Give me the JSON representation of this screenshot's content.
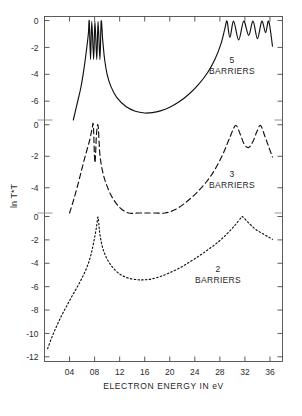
{
  "figure": {
    "title": "",
    "xlabel": "ELECTRON ENERGY  IN eV",
    "ylabel": "ln T*T",
    "xticks": [
      "04",
      "08",
      "12",
      "16",
      "20",
      "24",
      "28",
      "32",
      "36"
    ],
    "panel_labels": {
      "five": {
        "number": "5",
        "word": "BARRIERS"
      },
      "three": {
        "number": "3",
        "word": "BARRIERS"
      },
      "two": {
        "number": "2",
        "word": "BARRIERS"
      }
    },
    "yticks_top": [
      "0",
      "-2",
      "-4",
      "-6"
    ],
    "yticks_mid": [
      "0",
      "-2",
      "-4"
    ],
    "yticks_bot": [
      "0",
      "-2",
      "-4",
      "-6",
      "-8",
      "-10",
      "-12"
    ],
    "colors": {
      "ink": "#111111",
      "frame": "#4a4a4a",
      "paper": "#ffffff"
    }
  },
  "chart_data": {
    "type": "line",
    "title": "",
    "xlabel": "ELECTRON ENERGY  IN eV",
    "ylabel": "ln T*T",
    "xlim": [
      0.0,
      3.8
    ],
    "xtick_values": [
      0.4,
      0.8,
      1.2,
      1.6,
      2.0,
      2.4,
      2.8,
      3.2,
      3.6
    ],
    "xtick_labels": [
      "04",
      "08",
      "12",
      "16",
      "20",
      "24",
      "28",
      "32",
      "36"
    ],
    "grid": false,
    "legend": "inline-annotations",
    "note": "Three stacked panels share one x axis; each panel has its own ln T*T scale, all topping out at 0.",
    "panels": [
      {
        "name": "5 BARRIERS",
        "ylim": [
          -7.4,
          0.3
        ],
        "ytick_values": [
          0,
          -2,
          -4,
          -6
        ],
        "ytick_labels": [
          "0",
          "-2",
          "-4",
          "-6"
        ],
        "linestyle": "solid",
        "annotation": "5 BARRIERS"
      },
      {
        "name": "3 BARRIERS",
        "ylim": [
          -5.6,
          0.3
        ],
        "ytick_values": [
          0,
          -2,
          -4
        ],
        "ytick_labels": [
          "0",
          "-2",
          "-4"
        ],
        "linestyle": "dashed",
        "annotation": "3 BARRIERS"
      },
      {
        "name": "2 BARRIERS",
        "ylim": [
          -12.4,
          0.3
        ],
        "ytick_values": [
          0,
          -2,
          -4,
          -6,
          -8,
          -10,
          -12
        ],
        "ytick_labels": [
          "0",
          "-2",
          "-4",
          "-6",
          "-8",
          "-10",
          "-12"
        ],
        "linestyle": "dotted",
        "annotation": "2 BARRIERS"
      }
    ],
    "series": [
      {
        "name": "5 BARRIERS",
        "panel": 0,
        "linestyle": "solid",
        "description": "Four narrow resonance spikes reaching ln T*T = 0 near 0.72-0.92 eV, a deep opaque valley through mid-energies, then a band of four resonances reaching 0 between 2.85 and 3.6 eV.",
        "points": [
          [
            0.46,
            -7.4
          ],
          [
            0.52,
            -6.2
          ],
          [
            0.58,
            -5.0
          ],
          [
            0.63,
            -3.6
          ],
          [
            0.67,
            -2.2
          ],
          [
            0.7,
            -1.0
          ],
          [
            0.715,
            -0.05
          ],
          [
            0.735,
            -2.9
          ],
          [
            0.755,
            -0.05
          ],
          [
            0.785,
            -2.9
          ],
          [
            0.805,
            -0.05
          ],
          [
            0.835,
            -2.9
          ],
          [
            0.855,
            -0.05
          ],
          [
            0.885,
            -2.9
          ],
          [
            0.905,
            -0.05
          ],
          [
            0.93,
            -1.5
          ],
          [
            0.96,
            -2.9
          ],
          [
            1.0,
            -4.0
          ],
          [
            1.06,
            -4.9
          ],
          [
            1.15,
            -5.7
          ],
          [
            1.3,
            -6.4
          ],
          [
            1.45,
            -6.75
          ],
          [
            1.6,
            -6.88
          ],
          [
            1.72,
            -6.85
          ],
          [
            1.85,
            -6.72
          ],
          [
            2.0,
            -6.45
          ],
          [
            2.15,
            -6.05
          ],
          [
            2.3,
            -5.5
          ],
          [
            2.45,
            -4.8
          ],
          [
            2.6,
            -3.9
          ],
          [
            2.72,
            -2.9
          ],
          [
            2.82,
            -1.7
          ],
          [
            2.88,
            -0.6
          ],
          [
            2.915,
            -0.05
          ],
          [
            2.96,
            -1.25
          ],
          [
            3.02,
            -0.05
          ],
          [
            3.1,
            -1.45
          ],
          [
            3.18,
            -0.05
          ],
          [
            3.26,
            -1.1
          ],
          [
            3.33,
            -0.05
          ],
          [
            3.4,
            -1.35
          ],
          [
            3.47,
            -0.05
          ],
          [
            3.53,
            -0.9
          ],
          [
            3.58,
            -0.05
          ],
          [
            3.64,
            -1.9
          ]
        ]
      },
      {
        "name": "3 BARRIERS",
        "panel": 1,
        "linestyle": "dashed",
        "description": "Two resonance spikes reaching 0 near 0.78 and 0.86 eV, broad minimum near 1.6 eV, rising to two resonances at 0 near 3.05 and 3.45 eV.",
        "points": [
          [
            0.4,
            -5.6
          ],
          [
            0.47,
            -4.7
          ],
          [
            0.54,
            -3.7
          ],
          [
            0.6,
            -2.75
          ],
          [
            0.66,
            -1.85
          ],
          [
            0.72,
            -1.0
          ],
          [
            0.76,
            -0.25
          ],
          [
            0.78,
            -0.05
          ],
          [
            0.805,
            -2.4
          ],
          [
            0.83,
            -0.6
          ],
          [
            0.855,
            -0.05
          ],
          [
            0.885,
            -1.9
          ],
          [
            0.93,
            -3.0
          ],
          [
            0.99,
            -3.8
          ],
          [
            1.08,
            -4.6
          ],
          [
            1.2,
            -5.25
          ],
          [
            1.34,
            -5.65
          ],
          [
            1.5,
            -5.85
          ],
          [
            1.62,
            -5.9
          ],
          [
            1.76,
            -5.85
          ],
          [
            1.92,
            -5.7
          ],
          [
            2.08,
            -5.4
          ],
          [
            2.25,
            -4.95
          ],
          [
            2.42,
            -4.35
          ],
          [
            2.58,
            -3.65
          ],
          [
            2.72,
            -2.85
          ],
          [
            2.85,
            -1.85
          ],
          [
            2.96,
            -0.8
          ],
          [
            3.05,
            -0.05
          ],
          [
            3.12,
            -0.55
          ],
          [
            3.19,
            -1.25
          ],
          [
            3.26,
            -1.45
          ],
          [
            3.33,
            -1.05
          ],
          [
            3.39,
            -0.45
          ],
          [
            3.45,
            -0.05
          ],
          [
            3.52,
            -0.75
          ],
          [
            3.58,
            -1.4
          ],
          [
            3.64,
            -2.05
          ]
        ]
      },
      {
        "name": "2 BARRIERS",
        "panel": 2,
        "linestyle": "dotted",
        "description": "Single sharp resonance at 0 near 0.85 eV rising from ln T*T = -11.3 at 0.05 eV, broad minimum about -5.4 near 1.55 eV, single resonance at 0 near 3.15 eV.",
        "points": [
          [
            0.05,
            -11.3
          ],
          [
            0.12,
            -10.3
          ],
          [
            0.2,
            -9.3
          ],
          [
            0.28,
            -8.4
          ],
          [
            0.36,
            -7.6
          ],
          [
            0.44,
            -6.8
          ],
          [
            0.52,
            -6.05
          ],
          [
            0.6,
            -5.25
          ],
          [
            0.68,
            -4.3
          ],
          [
            0.74,
            -3.3
          ],
          [
            0.79,
            -2.1
          ],
          [
            0.83,
            -0.9
          ],
          [
            0.855,
            -0.05
          ],
          [
            0.88,
            -1.35
          ],
          [
            0.92,
            -2.5
          ],
          [
            0.97,
            -3.3
          ],
          [
            1.04,
            -4.0
          ],
          [
            1.13,
            -4.6
          ],
          [
            1.24,
            -5.05
          ],
          [
            1.36,
            -5.3
          ],
          [
            1.48,
            -5.4
          ],
          [
            1.58,
            -5.42
          ],
          [
            1.7,
            -5.35
          ],
          [
            1.84,
            -5.15
          ],
          [
            1.98,
            -4.85
          ],
          [
            2.14,
            -4.45
          ],
          [
            2.3,
            -3.95
          ],
          [
            2.46,
            -3.4
          ],
          [
            2.62,
            -2.8
          ],
          [
            2.78,
            -2.15
          ],
          [
            2.92,
            -1.45
          ],
          [
            3.04,
            -0.75
          ],
          [
            3.14,
            -0.1
          ],
          [
            3.17,
            -0.05
          ],
          [
            3.26,
            -0.55
          ],
          [
            3.36,
            -1.05
          ],
          [
            3.46,
            -1.4
          ],
          [
            3.56,
            -1.7
          ],
          [
            3.64,
            -1.95
          ]
        ]
      }
    ]
  }
}
